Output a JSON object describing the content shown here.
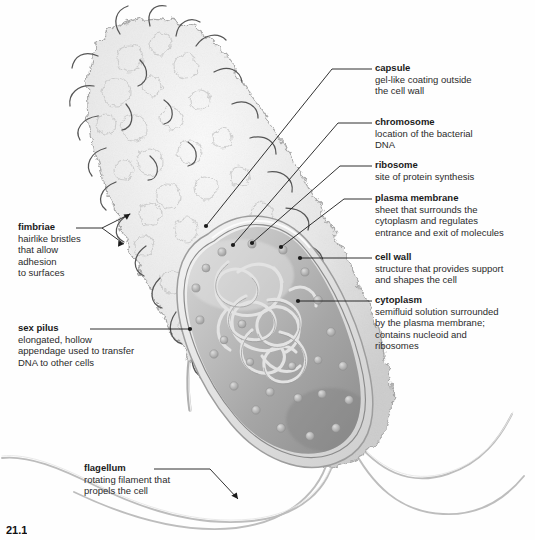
{
  "figure": {
    "caption": "21.1",
    "background_color": "#fefefe",
    "ink_color": "#1a1a1a"
  },
  "labels": {
    "capsule": {
      "title": "capsule",
      "desc": "gel-like coating outside\nthe cell wall"
    },
    "chromosome": {
      "title": "chromosome",
      "desc": "location of the bacterial\nDNA"
    },
    "ribosome": {
      "title": "ribosome",
      "desc": "site of protein synthesis"
    },
    "plasma_membrane": {
      "title": "plasma membrane",
      "desc": "sheet that surrounds the\ncytoplasm and regulates\nentrance and exit of molecules"
    },
    "cell_wall": {
      "title": "cell wall",
      "desc": "structure that provides support\nand shapes the cell"
    },
    "cytoplasm": {
      "title": "cytoplasm",
      "desc": "semifluid solution surrounded\nby the plasma membrane;\ncontains nucleoid and\nribosomes"
    },
    "fimbriae": {
      "title": "fimbriae",
      "desc": "hairlike bristles\nthat allow\nadhesion\nto surfaces"
    },
    "sex_pilus": {
      "title": "sex pilus",
      "desc": "elongated, hollow\nappendage used to transfer\nDNA to other cells"
    },
    "flagellum": {
      "title": "flagellum",
      "desc": "rotating filament that\npropels the cell"
    }
  },
  "colors": {
    "capsule_fill": "#ededed",
    "capsule_edge": "#9a9a9a",
    "wall_fill": "#e2e2e2",
    "cytoplasm_light": "#c9c9c9",
    "cytoplasm_dark": "#8e8e8e",
    "chromosome_stroke": "#dcdcdc",
    "ribosome_fill": "#b8b8b8",
    "flagellum_stroke": "#b5b5b5",
    "leader_line": "#1a1a1a"
  }
}
